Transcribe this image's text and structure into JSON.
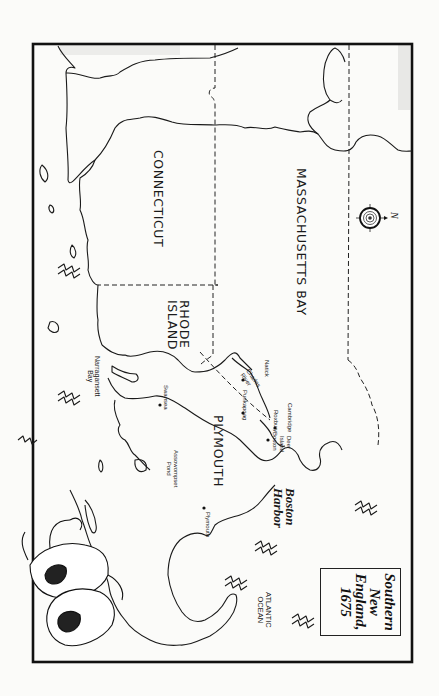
{
  "map": {
    "title": {
      "line1": "Southern",
      "line2": "New",
      "line3": "England,",
      "line4": "1675"
    },
    "orientation": "rotated 90° clockwise (north arrow points right)",
    "compass": {
      "label": "N"
    },
    "colonies": [
      {
        "name": "MASSACHUSETTS BAY"
      },
      {
        "name": "CONNECTICUT"
      },
      {
        "name": "RHODE ISLAND",
        "line1": "RHODE",
        "line2": "ISLAND"
      },
      {
        "name": "PLYMOUTH"
      }
    ],
    "water_bodies": [
      {
        "name": "Boston Harbor",
        "line1": "Boston",
        "line2": "Harbor"
      },
      {
        "name": "ATLANTIC OCEAN",
        "line1": "ATLANTIC",
        "line2": "OCEAN"
      },
      {
        "name": "Narragansett Bay",
        "line1": "Narragansett",
        "line2": "Bay"
      },
      {
        "name": "Assowompset Pond",
        "line1": "Assowompset",
        "line2": "Pond"
      },
      {
        "name": "Charles River",
        "line1": "Charles",
        "line2": "River"
      }
    ],
    "towns": [
      {
        "name": "Natick"
      },
      {
        "name": "Punkapoag"
      },
      {
        "name": "Cambridge"
      },
      {
        "name": "Roxbury"
      },
      {
        "name": "Boston"
      },
      {
        "name": "Deer Island",
        "line1": "Deer",
        "line2": "Island"
      },
      {
        "name": "Swansea"
      },
      {
        "name": "Plymouth"
      }
    ],
    "colors": {
      "background": "#fbfbf9",
      "ink": "#1a1a1a"
    }
  }
}
